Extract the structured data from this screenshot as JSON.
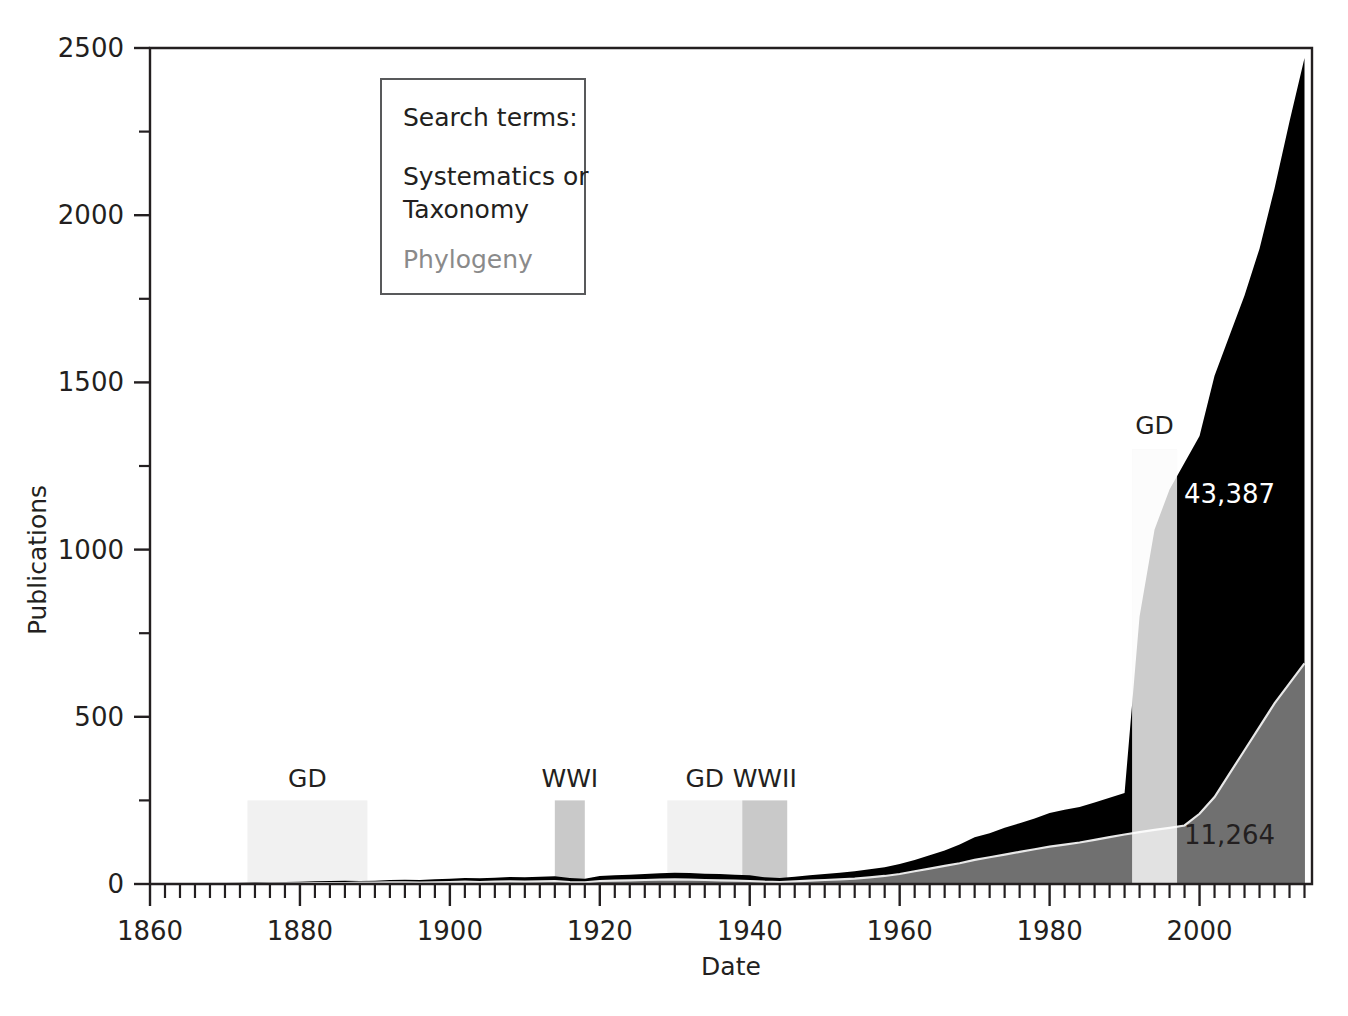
{
  "chart_data": {
    "type": "area",
    "title": "",
    "xlabel": "Date",
    "ylabel": "Publications",
    "xlim": [
      1860,
      2015
    ],
    "ylim": [
      0,
      2500
    ],
    "grid": false,
    "xticks": [
      1860,
      1880,
      1900,
      1920,
      1940,
      1960,
      1980,
      2000
    ],
    "xtick_labels": [
      "1860",
      "1880",
      "1900",
      "1920",
      "1940",
      "1960",
      "1980",
      "2000"
    ],
    "x_minor_tick_step": 2,
    "yticks": [
      0,
      500,
      1000,
      1500,
      2000,
      2500
    ],
    "ytick_labels": [
      "0",
      "500",
      "1000",
      "1500",
      "2000",
      "2500"
    ],
    "y_minor_ticks": [
      250,
      750,
      1250,
      1750,
      2250
    ],
    "legend_position": "upper-left-inset",
    "legend_title": "Search terms:",
    "series": [
      {
        "name": "Systematics or Taxonomy",
        "color": "#000000",
        "total_label": "43,387",
        "x": [
          1860,
          1862,
          1864,
          1866,
          1868,
          1870,
          1872,
          1874,
          1876,
          1878,
          1880,
          1882,
          1884,
          1886,
          1888,
          1890,
          1892,
          1894,
          1896,
          1898,
          1900,
          1902,
          1904,
          1906,
          1908,
          1910,
          1912,
          1914,
          1916,
          1918,
          1920,
          1922,
          1924,
          1926,
          1928,
          1930,
          1932,
          1934,
          1936,
          1938,
          1940,
          1942,
          1944,
          1946,
          1948,
          1950,
          1952,
          1954,
          1956,
          1958,
          1960,
          1962,
          1964,
          1966,
          1968,
          1970,
          1972,
          1974,
          1976,
          1978,
          1980,
          1982,
          1984,
          1986,
          1988,
          1990,
          1992,
          1994,
          1996,
          1998,
          2000,
          2002,
          2004,
          2006,
          2008,
          2010,
          2012,
          2014
        ],
        "values": [
          1,
          1,
          2,
          2,
          3,
          3,
          4,
          5,
          5,
          6,
          7,
          8,
          9,
          10,
          9,
          10,
          12,
          13,
          12,
          14,
          16,
          18,
          17,
          19,
          21,
          20,
          22,
          23,
          18,
          16,
          24,
          26,
          28,
          30,
          32,
          34,
          33,
          31,
          30,
          28,
          26,
          20,
          18,
          22,
          26,
          30,
          34,
          38,
          44,
          50,
          60,
          72,
          86,
          100,
          118,
          140,
          152,
          168,
          182,
          196,
          212,
          222,
          230,
          244,
          258,
          272,
          800,
          1060,
          1180,
          1260,
          1340,
          1520,
          1640,
          1760,
          1900,
          2080,
          2280,
          2470
        ]
      },
      {
        "name": "Phylogeny",
        "color": "#707070",
        "total_label": "11,264",
        "x": [
          1860,
          1862,
          1864,
          1866,
          1868,
          1870,
          1872,
          1874,
          1876,
          1878,
          1880,
          1882,
          1884,
          1886,
          1888,
          1890,
          1892,
          1894,
          1896,
          1898,
          1900,
          1902,
          1904,
          1906,
          1908,
          1910,
          1912,
          1914,
          1916,
          1918,
          1920,
          1922,
          1924,
          1926,
          1928,
          1930,
          1932,
          1934,
          1936,
          1938,
          1940,
          1942,
          1944,
          1946,
          1948,
          1950,
          1952,
          1954,
          1956,
          1958,
          1960,
          1962,
          1964,
          1966,
          1968,
          1970,
          1972,
          1974,
          1976,
          1978,
          1980,
          1982,
          1984,
          1986,
          1988,
          1990,
          1992,
          1994,
          1996,
          1998,
          2000,
          2002,
          2004,
          2006,
          2008,
          2010,
          2012,
          2014
        ],
        "values": [
          0,
          0,
          0,
          0,
          1,
          1,
          1,
          1,
          2,
          2,
          2,
          3,
          3,
          3,
          4,
          4,
          5,
          5,
          4,
          5,
          6,
          7,
          6,
          7,
          8,
          7,
          8,
          9,
          6,
          5,
          9,
          10,
          11,
          12,
          13,
          14,
          13,
          12,
          11,
          10,
          9,
          7,
          6,
          8,
          10,
          12,
          14,
          16,
          20,
          24,
          30,
          38,
          46,
          54,
          62,
          72,
          80,
          88,
          96,
          104,
          112,
          118,
          124,
          132,
          140,
          148,
          155,
          162,
          168,
          175,
          210,
          260,
          330,
          400,
          470,
          540,
          600,
          660
        ]
      }
    ],
    "value_annotations": [
      {
        "label": "43,387",
        "series": "Systematics or Taxonomy",
        "x": 2004,
        "y": 1140,
        "text_color": "#ffffff"
      },
      {
        "label": "11,264",
        "series": "Phylogeny",
        "x": 2004,
        "y": 120,
        "text_color": "#231f20"
      }
    ],
    "event_bands": [
      {
        "label": "GD",
        "start": 1873,
        "end": 1889,
        "top_value": 250,
        "color": "#f1f1f1",
        "label_y_value": 290
      },
      {
        "label": "WWI",
        "start": 1914,
        "end": 1918,
        "top_value": 250,
        "color": "#c9c9c9",
        "label_y_value": 290
      },
      {
        "label": "GD",
        "start": 1929,
        "end": 1939,
        "top_value": 250,
        "color": "#f1f1f1",
        "label_y_value": 290
      },
      {
        "label": "WWII",
        "start": 1939,
        "end": 1945,
        "top_value": 250,
        "color": "#c9c9c9",
        "label_y_value": 290
      },
      {
        "label": "GD",
        "start": 1991,
        "end": 1997,
        "top_value": 1300,
        "color": "#eeeeee",
        "label_y_value": 1345
      }
    ]
  },
  "legend": {
    "title": "Search terms:",
    "entries": [
      {
        "label_line1": "Systematics or",
        "label_line2": "Taxonomy",
        "color": "#231f20"
      },
      {
        "label_line1": "Phylogeny",
        "label_line2": "",
        "color": "#8a8a8a"
      }
    ]
  },
  "axes": {
    "y_title": "Publications",
    "x_title": "Date"
  }
}
